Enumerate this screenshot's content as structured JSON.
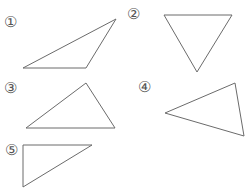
{
  "figures": [
    {
      "label": "①",
      "label_pos": [
        4,
        15
      ],
      "points": "23,68 116,19 86,68"
    },
    {
      "label": "②",
      "label_pos": [
        127,
        7
      ],
      "points": "164,15 232,15 197,72"
    },
    {
      "label": "③",
      "label_pos": [
        4,
        81
      ],
      "points": "26,128 86,83 115,128"
    },
    {
      "label": "④",
      "label_pos": [
        138,
        80
      ],
      "points": "165,113 235,83 244,136"
    },
    {
      "label": "⑤",
      "label_pos": [
        5,
        143
      ],
      "points": "23,145 92,145 23,187"
    }
  ],
  "stroke_color": "#6b6b6b"
}
